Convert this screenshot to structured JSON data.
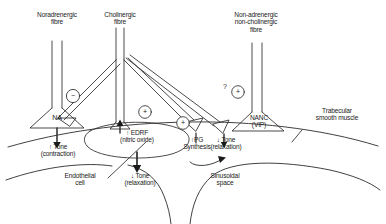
{
  "figure": {
    "type": "physiology-pathway-diagram"
  },
  "fibres": {
    "noradrenergic": {
      "label": "Noradrenergic\nfibre",
      "terminal": "NA"
    },
    "cholinergic": {
      "label": "Cholinergic\nfibre"
    },
    "nanc": {
      "label": "Non-adrenergic\nnon-cholinergic\nfibre",
      "terminal": "NANC\n(VIP)"
    }
  },
  "signals": {
    "inhibitory_na": "−",
    "excitatory_edrf": "+",
    "excitatory_pg": "+",
    "excitatory_nanc": "+",
    "query": "?"
  },
  "mediators": {
    "edrf": "↑ EDRF\n(nitric oxide)",
    "pg": "↑PG\nSynthesis"
  },
  "effects": {
    "na_tone": "↑ Tone\n(contraction)",
    "endothelial_tone": "↓ Tone\n(relaxation)",
    "nanc_tone": "↓ Tone\n(relaxation)"
  },
  "structures": {
    "trabecular": "Trabecular\nsmooth muscle",
    "endothelial": "Endothelial\ncell",
    "sinusoidal": "Sinusoidal\nspace"
  },
  "colors": {
    "ink": "#1a1a1a",
    "line": "#2b2b2b",
    "background": "#ffffff"
  }
}
